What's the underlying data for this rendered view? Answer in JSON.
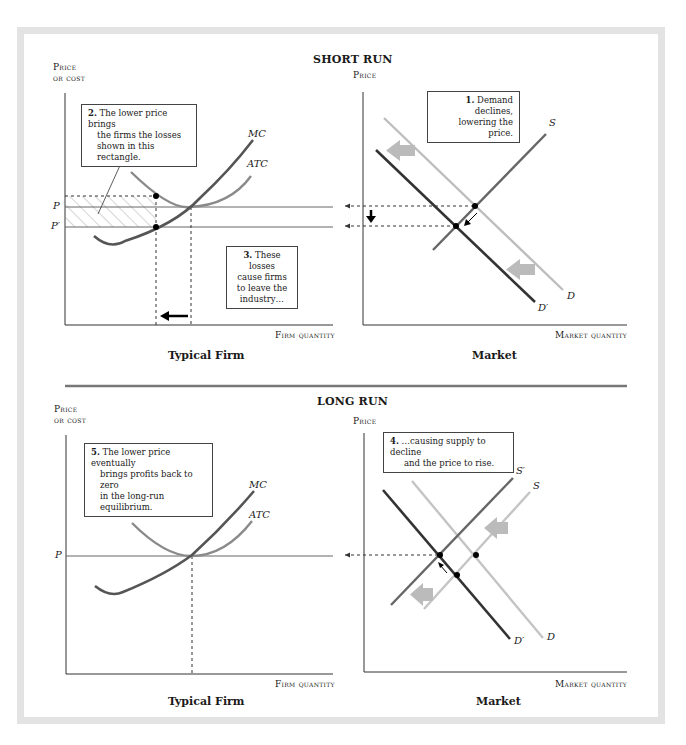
{
  "figure": {
    "short_run": {
      "title": "SHORT RUN",
      "firm": {
        "y_axis_label_line1": "Price",
        "y_axis_label_line2": "or cost",
        "x_axis_label": "Firm quantity",
        "panel_title": "Typical Firm",
        "curves": {
          "mc": "MC",
          "atc": "ATC"
        },
        "price_labels": {
          "p": "P",
          "p_prime": "P′"
        },
        "callout_2": {
          "number": "2.",
          "text_line1": "The lower price brings",
          "text_line2": "the firms the losses",
          "text_line3": "shown in this rectangle."
        },
        "callout_3": {
          "number": "3.",
          "text_line1": "These losses",
          "text_line2": "cause firms",
          "text_line3": "to leave the",
          "text_line4": "industry…"
        }
      },
      "market": {
        "y_axis_label": "Price",
        "x_axis_label": "Market quantity",
        "panel_title": "Market",
        "curves": {
          "s": "S",
          "d": "D",
          "d_prime": "D′"
        },
        "callout_1": {
          "number": "1.",
          "text_line1": "Demand declines,",
          "text_line2": "lowering the price."
        }
      }
    },
    "long_run": {
      "title": "LONG RUN",
      "firm": {
        "y_axis_label_line1": "Price",
        "y_axis_label_line2": "or cost",
        "x_axis_label": "Firm quantity",
        "panel_title": "Typical Firm",
        "curves": {
          "mc": "MC",
          "atc": "ATC"
        },
        "price_labels": {
          "p": "P"
        },
        "callout_5": {
          "number": "5.",
          "text_line1": "The lower price eventually",
          "text_line2": "brings profits back to zero",
          "text_line3": "in the long-run equilibrium."
        }
      },
      "market": {
        "y_axis_label": "Price",
        "x_axis_label": "Market quantity",
        "panel_title": "Market",
        "curves": {
          "s": "S",
          "s_prime": "S′",
          "d": "D",
          "d_prime": "D′"
        },
        "callout_4": {
          "number": "4.",
          "text_line1": "…causing supply to decline",
          "text_line2": "and the price to rise."
        }
      }
    },
    "colors": {
      "frame": "#e3e3e3",
      "axis": "#333333",
      "mc_curve": "#555555",
      "atc_curve": "#8a8a8a",
      "d_curve_old": "#bdbdbd",
      "d_prime_curve": "#333333",
      "s_curve": "#666666",
      "s_old_curve_long_run": "#c4c4c4",
      "shift_arrow": "#bbbbbb",
      "hatch": "#aaaaaa",
      "separator": "#777777"
    }
  }
}
